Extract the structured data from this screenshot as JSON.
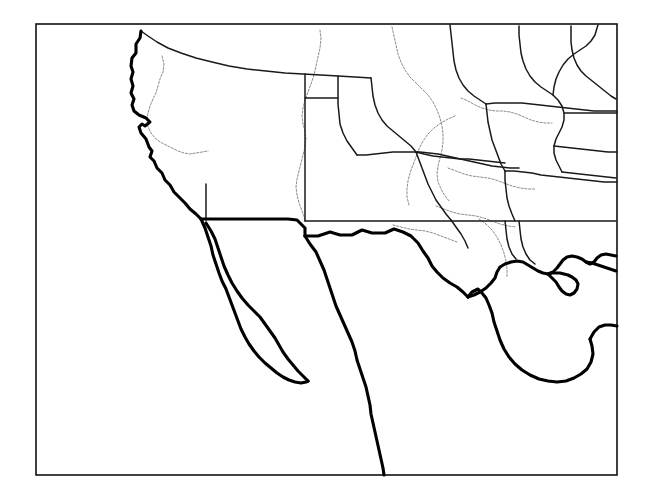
{
  "map": {
    "title": "Outline map of southwestern and central North America",
    "region": "Southwestern United States, Mexico and Central United States",
    "projection_note": "Lambert conformal-like outline, no labels",
    "background_color": "#ffffff",
    "frame": {
      "name": "map-neatline",
      "x": 36,
      "y": 24,
      "width": 581,
      "height": 451,
      "stroke_color": "#111111",
      "stroke_width": 1.6
    },
    "legend_styles": [
      {
        "name": "coastline",
        "color": "#000000",
        "width": 3.1,
        "dash": "solid"
      },
      {
        "name": "international-border",
        "color": "#000000",
        "width": 3.1,
        "dash": "solid"
      },
      {
        "name": "state-border",
        "color": "#1a1a1a",
        "width": 1.5,
        "dash": "solid"
      },
      {
        "name": "river",
        "color": "#8c8c8c",
        "width": 1.0,
        "dash": "dotted"
      }
    ],
    "features": {
      "pacific_coast_us": "M 141 31 L 140 38 L 136 44 L 136 53 L 132 58 L 131 66 L 133 72 L 131 79 L 133 86 L 131 93 L 134 99 L 132 105 L 134 111 L 139 115 L 146 118 L 150 122 L 145 126 L 142 124 L 139 127 L 141 133 L 146 139 L 149 147 L 152 151 L 150 157 L 154 161 L 157 168 L 162 173 L 165 180 L 170 185 L 174 192 L 179 197 L 185 203 L 190 209 L 196 214 L 201 219",
      "us_mex_border_straight_west": "M 201 219 L 241 219 L 253 219 L 272 219 L 288 219 L 297 220 L 305 228 L 305 236",
      "us_mex_border_gila_rio": "M 305 236 L 318 236 L 330 232 L 340 235 L 352 235 L 362 230 L 372 233 L 385 233 L 394 229 L 403 232 L 411 236 L 418 243 L 423 251 L 428 258 L 432 266 L 437 272 L 443 278 L 450 283 L 457 287 L 463 292 L 468 297",
      "gulf_coast_mexico_to_yucatan": "M 468 297 L 472 292 L 478 289 L 482 293 L 486 298 L 489 305 L 492 313 L 494 322 L 497 331 L 500 340 L 504 349 L 509 357 L 515 364 L 522 370 L 530 375 L 539 379 L 548 381 L 557 382 L 566 381 L 574 378 L 581 374 L 587 369 L 591 362 L 593 354 L 592 346 L 590 339",
      "yucatan_east_edge": "M 590 339 L 594 332 L 599 327 L 605 325 L 611 325 L 617 326",
      "mexico_pacific_coast_south": "M 305 236 L 310 244 L 316 252 L 320 261 L 324 270 L 327 279 L 330 288 L 333 297 L 336 306 L 340 315 L 344 324 L 348 333 L 352 342 L 355 351 L 357 360 L 360 369 L 363 378 L 366 387 L 368 396 L 370 405 L 371 414 L 373 423 L 375 432 L 377 441 L 379 450 L 381 459 L 383 468 L 384 475",
      "baja_peninsula_east": "M 206 223 L 211 231 L 215 239 L 218 248 L 221 257 L 224 266 L 228 275 L 232 283 L 237 291 L 242 298 L 248 305 L 254 311 L 260 317 L 265 324 L 270 331 L 275 338 L 279 345 L 283 352 L 288 359 L 293 365 L 298 371 L 303 376 L 308 381",
      "baja_peninsula_west": "M 201 219 L 205 228 L 208 237 L 211 246 L 213 255 L 216 264 L 219 273 L 222 281 L 226 289 L 229 297 L 232 305 L 235 313 L 238 321 L 241 329 L 245 337 L 249 344 L 254 351 L 259 357 L 265 363 L 271 368 L 277 373 L 283 377 L 289 380 L 295 382 L 301 383 L 306 382 L 308 381",
      "sea_of_cortez_inner": "M 206 223 L 212 235 L 216 247 L 220 259 L 225 271 L 231 282 L 238 292 L 246 301 L 254 309 L 262 317 L 270 325 L 277 333 L 284 341 L 291 349 L 297 356 L 303 363 L 308 369",
      "rivers": [
        "M 162 56 L 164 64 L 163 72 L 160 79 L 158 86 L 156 93 L 153 99 L 150 106 L 148 113 L 147 120 L 148 127 L 151 133 L 155 138 L 160 142 L 166 145 L 172 148 L 178 151 L 184 153 L 190 154 L 196 153 L 202 152 L 208 151",
        "M 320 30 L 321 39 L 320 48 L 318 57 L 316 66 L 314 75 L 311 84 L 308 92 L 305 100 L 303 108 L 302 116 L 303 124 L 305 131 L 306 139 L 305 147 L 303 155 L 301 163 L 299 171 L 297 179 L 296 187 L 297 195 L 299 203 L 302 211 L 305 219",
        "M 392 27 L 394 36 L 396 45 L 398 54 L 401 62 L 405 70 L 410 77 L 416 83 L 422 89 L 428 95 L 433 102 L 437 110 L 440 118 L 442 126 L 443 134 L 443 142 L 442 150 L 440 158 L 438 166 L 437 174 L 438 182 L 441 189 L 445 196 L 450 202",
        "M 455 116 L 448 119 L 441 123 L 434 128 L 428 134 L 423 141 L 419 149 L 416 157 L 413 165 L 410 173 L 408 181 L 407 189 L 407 197 L 409 205",
        "M 461 98 L 468 101 L 475 105 L 482 108 L 489 110 L 496 111 L 503 111 L 510 112 L 517 114 L 524 117 L 531 120 L 538 122 L 545 123 L 552 123",
        "M 448 168 L 456 171 L 464 174 L 472 176 L 480 177 L 488 178 L 496 180 L 504 183 L 512 186 L 520 188 L 528 189 L 536 189",
        "M 436 206 L 444 209 L 452 212 L 460 214 L 468 215 L 476 216 L 484 218 L 492 221 L 500 224 L 508 226 L 516 227",
        "M 393 225 L 401 227 L 409 229 L 417 230 L 425 231 L 433 233 L 441 236 L 449 239 L 457 242",
        "M 479 219 L 486 224 L 492 230 L 497 237 L 501 245 L 504 253 L 506 261 L 507 269 L 507 277",
        "M 248 341 L 252 346 L 255 351"
      ],
      "state_borders": [
        "M 141 31 L 148 36 L 157 42 L 168 48 L 181 53 L 196 58 L 212 62 L 229 66 L 247 69 L 266 71 L 285 73 L 303 74 L 321 75 L 338 76 L 355 77 L 371 78",
        "M 338 76 L 338 84 L 338 94 L 338 104 L 339 114 L 340 124 L 343 133 L 347 141 L 352 148 L 357 155",
        "M 305 74 L 305 86 L 305 99 L 305 112 L 305 126 L 305 140 L 305 154 L 305 168 L 305 182 L 305 196 L 305 210 L 305 221",
        "M 305 221 L 316 221 L 328 221 L 340 221 L 352 221 L 364 221 L 376 221 L 388 221 L 400 221 L 412 221 L 424 221 L 436 221 L 448 221 L 460 221 L 472 221 L 484 221 L 496 221 L 508 221 L 520 221 L 532 221 L 544 221 L 556 221 L 568 221 L 580 221 L 592 221 L 604 221 L 616 221",
        "M 357 155 L 366 155 L 375 154 L 384 153 L 393 152 L 402 152 L 411 152 L 420 152 L 429 153 L 438 154 L 447 156 L 456 158 L 465 160 L 474 162 L 483 164 L 492 166 L 501 167 L 510 168 L 519 168",
        "M 371 78 L 372 87 L 373 96 L 375 105 L 378 113 L 382 120 L 387 126 L 393 131 L 399 136 L 405 141 L 411 146 L 416 152",
        "M 416 152 L 424 154 L 433 156 L 442 157 L 451 158 L 460 159 L 469 159 L 478 160 L 487 161 L 496 162 L 505 163",
        "M 416 152 L 419 160 L 422 168 L 425 176 L 428 184 L 432 192 L 436 200 L 441 207 L 446 214 L 451 220",
        "M 450 25 L 451 34 L 452 43 L 453 52 L 454 61 L 456 70 L 459 78 L 463 85 L 468 91 L 474 96 L 480 100 L 486 104",
        "M 486 104 L 487 113 L 488 122 L 490 131 L 492 140 L 495 148 L 498 156 L 501 164 L 505 171",
        "M 505 171 L 505 180 L 506 189 L 507 198 L 509 206 L 512 214 L 515 221",
        "M 486 104 L 495 103 L 504 103 L 513 103 L 522 103 L 531 104 L 540 105 L 549 106 L 558 107 L 567 108 L 576 109 L 585 110 L 594 111 L 603 111 L 612 111 L 617 111",
        "M 505 171 L 514 171 L 523 172 L 532 173 L 541 175 L 550 176 L 559 177 L 568 178 L 577 179 L 586 180 L 595 181 L 604 182 L 613 182 L 617 182",
        "M 519 26 L 519 35 L 520 44 L 521 53 L 523 61 L 526 69 L 530 76 L 535 82 L 541 87 L 547 91 L 553 95 L 558 100 L 562 106 L 564 113 L 564 120 L 562 127 L 559 133 L 556 139 L 554 146 L 554 153 L 556 160 L 559 166 L 562 172",
        "M 553 95 L 554 87 L 556 79 L 559 72 L 563 65 L 568 59 L 574 54 L 580 50 L 586 46 L 591 41 L 595 35 L 597 28 L 598 25",
        "M 564 113 L 573 113 L 582 113 L 591 113 L 600 113 L 609 113 L 617 113",
        "M 571 26 L 571 34 L 571 42 L 572 50 L 574 58 L 577 65 L 581 71 L 586 76 L 591 80 L 596 84 L 601 88 L 606 92 L 611 96 L 616 99",
        "M 554 146 L 563 147 L 572 148 L 581 149 L 590 150 L 599 151 L 608 152 L 617 152",
        "M 562 172 L 571 173 L 580 174 L 589 175 L 598 176 L 607 177 L 616 178",
        "M 519 221 L 520 230 L 521 239 L 523 247 L 526 254 L 530 260 L 535 264",
        "M 505 221 L 506 230 L 507 239 L 509 247 L 512 254 L 516 259",
        "M 451 220 L 456 227 L 461 234 L 465 241 L 468 248",
        "M 206 220 L 206 211 L 206 202 L 206 193 L 206 184",
        "M 305 98 L 314 98 L 323 98 L 332 98 L 338 98"
      ],
      "gulf_coast_us": "M 468 297 L 474 295 L 480 292 L 486 288 L 491 283 L 495 278 L 497 272 L 500 267 L 505 264 L 511 262 L 517 261 L 523 262 L 528 265 L 533 268 L 538 271 L 543 273 L 548 274 L 553 272 L 557 268 L 560 264 L 563 260 L 567 257 L 572 256 L 577 257 L 582 259 L 586 262 L 590 264 L 594 262 L 597 258 L 601 255 L 606 254 L 611 255 L 616 256",
      "mississippi_delta": "M 548 274 L 552 278 L 556 282 L 559 287 L 562 291 L 566 294 L 570 295 L 574 293 L 577 289 L 578 284 L 576 280 L 572 277 L 568 275 L 564 274 L 560 273 L 556 273 L 552 273 L 548 274",
      "florida_panhandle_edge": "M 586 262 L 592 263 L 598 265 L 604 267 L 610 269 L 616 271"
    }
  }
}
